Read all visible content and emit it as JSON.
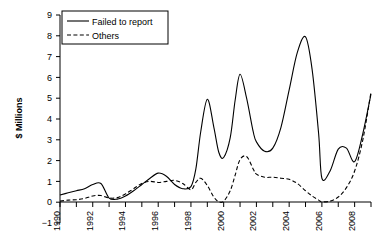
{
  "chart_data": {
    "type": "line",
    "title": "",
    "xlabel": "",
    "ylabel": "$ Millions",
    "ylim": [
      -1,
      9
    ],
    "xlim": [
      1990,
      2009
    ],
    "grid": false,
    "legend_position": "top-left",
    "ytick_labels": [
      "9",
      "8",
      "7",
      "6",
      "5",
      "4",
      "3",
      "2",
      "1",
      "0",
      "-1"
    ],
    "ytick_values": [
      9,
      8,
      7,
      6,
      5,
      4,
      3,
      2,
      1,
      0,
      -1
    ],
    "xtick_labels": [
      "1990",
      "1992",
      "1994",
      "1996",
      "1998",
      "2000",
      "2002",
      "2004",
      "2006",
      "2008"
    ],
    "xtick_values": [
      1990,
      1992,
      1994,
      1996,
      1998,
      2000,
      2002,
      2004,
      2006,
      2008
    ],
    "xtick_minor_values": [
      1991,
      1993,
      1995,
      1997,
      1999,
      2001,
      2003,
      2005,
      2007,
      2009
    ],
    "x": [
      1990,
      1990.5,
      1991,
      1991.5,
      1992,
      1992.5,
      1993,
      1993.5,
      1994,
      1994.5,
      1995,
      1995.5,
      1996,
      1996.5,
      1997,
      1997.5,
      1998,
      1998.3,
      1998.6,
      1999,
      1999.4,
      1999.7,
      2000,
      2000.4,
      2000.7,
      2001,
      2001.4,
      2001.8,
      2002,
      2002.5,
      2003,
      2003.5,
      2004,
      2004.5,
      2005,
      2005.4,
      2005.8,
      2006,
      2006.5,
      2007,
      2007.5,
      2008,
      2008.5,
      2009
    ],
    "series": [
      {
        "name": "Failed to report",
        "style": "solid",
        "values": [
          0.35,
          0.45,
          0.55,
          0.65,
          0.85,
          0.9,
          0.2,
          0.15,
          0.3,
          0.55,
          0.85,
          1.15,
          1.4,
          1.25,
          0.85,
          0.65,
          0.75,
          1.6,
          3.4,
          4.95,
          3.6,
          2.4,
          2.15,
          3.1,
          4.9,
          6.15,
          5.0,
          3.4,
          2.9,
          2.45,
          2.6,
          3.6,
          5.4,
          7.2,
          7.95,
          6.4,
          3.3,
          1.15,
          1.5,
          2.55,
          2.6,
          1.95,
          3.3,
          5.2
        ]
      },
      {
        "name": "Others",
        "style": "dashed",
        "values": [
          0.05,
          0.1,
          0.12,
          0.18,
          0.3,
          0.32,
          0.2,
          0.22,
          0.4,
          0.65,
          0.9,
          1.0,
          0.95,
          1.0,
          1.05,
          0.9,
          0.6,
          0.95,
          1.15,
          0.8,
          0.25,
          0.02,
          0.05,
          0.55,
          1.3,
          2.05,
          2.2,
          1.6,
          1.35,
          1.2,
          1.2,
          1.15,
          1.1,
          0.9,
          0.55,
          0.3,
          0.1,
          0.02,
          0.05,
          0.25,
          0.7,
          1.5,
          3.0,
          5.3
        ]
      }
    ],
    "legend_entries": [
      {
        "label": "Failed to report",
        "style": "solid"
      },
      {
        "label": "Others",
        "style": "dashed"
      }
    ]
  }
}
